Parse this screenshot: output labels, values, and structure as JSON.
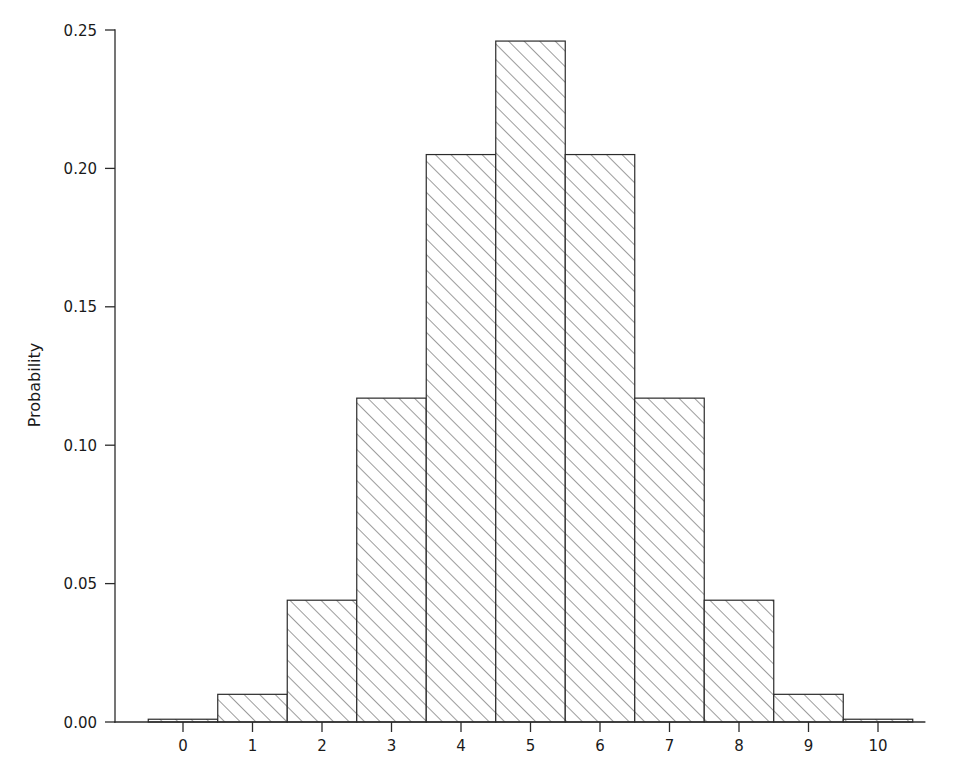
{
  "chart_data": {
    "type": "bar",
    "title": "",
    "subtitle": "",
    "xlabel": "",
    "ylabel": "Probability",
    "categories": [
      "0",
      "1",
      "2",
      "3",
      "4",
      "5",
      "6",
      "7",
      "8",
      "9",
      "10"
    ],
    "x": [
      0,
      1,
      2,
      3,
      4,
      5,
      6,
      7,
      8,
      9,
      10
    ],
    "values": [
      0.001,
      0.01,
      0.044,
      0.117,
      0.205,
      0.246,
      0.205,
      0.117,
      0.044,
      0.01,
      0.001
    ],
    "xlim": [
      -0.5,
      10.5
    ],
    "ylim": [
      0.0,
      0.25
    ],
    "xticks": [
      0,
      1,
      2,
      3,
      4,
      5,
      6,
      7,
      8,
      9,
      10
    ],
    "xtick_labels": [
      "0",
      "1",
      "2",
      "3",
      "4",
      "5",
      "6",
      "7",
      "8",
      "9",
      "10"
    ],
    "yticks": [
      0.0,
      0.05,
      0.1,
      0.15,
      0.2,
      0.25
    ],
    "ytick_labels": [
      "0.00",
      "0.05",
      "0.10",
      "0.15",
      "0.20",
      "0.25"
    ],
    "grid": false,
    "legend": null,
    "legend_position": "none",
    "bar_width": 1.0,
    "fill_pattern": "diagonal-hatch",
    "annotations": []
  },
  "axes": {
    "y_axis_title": "Probability",
    "y_tick_labels": [
      "0.25",
      "0.20",
      "0.15",
      "0.10",
      "0.05",
      "0.00"
    ],
    "x_tick_labels": [
      "0",
      "1",
      "2",
      "3",
      "4",
      "5",
      "6",
      "7",
      "8",
      "9",
      "10"
    ]
  },
  "colors": {
    "background": "#ffffff",
    "axis": "#2b2b2b",
    "text": "#1a1a1a",
    "bar_outline": "#2b2b2b",
    "hatch": "#3a3a3a"
  }
}
